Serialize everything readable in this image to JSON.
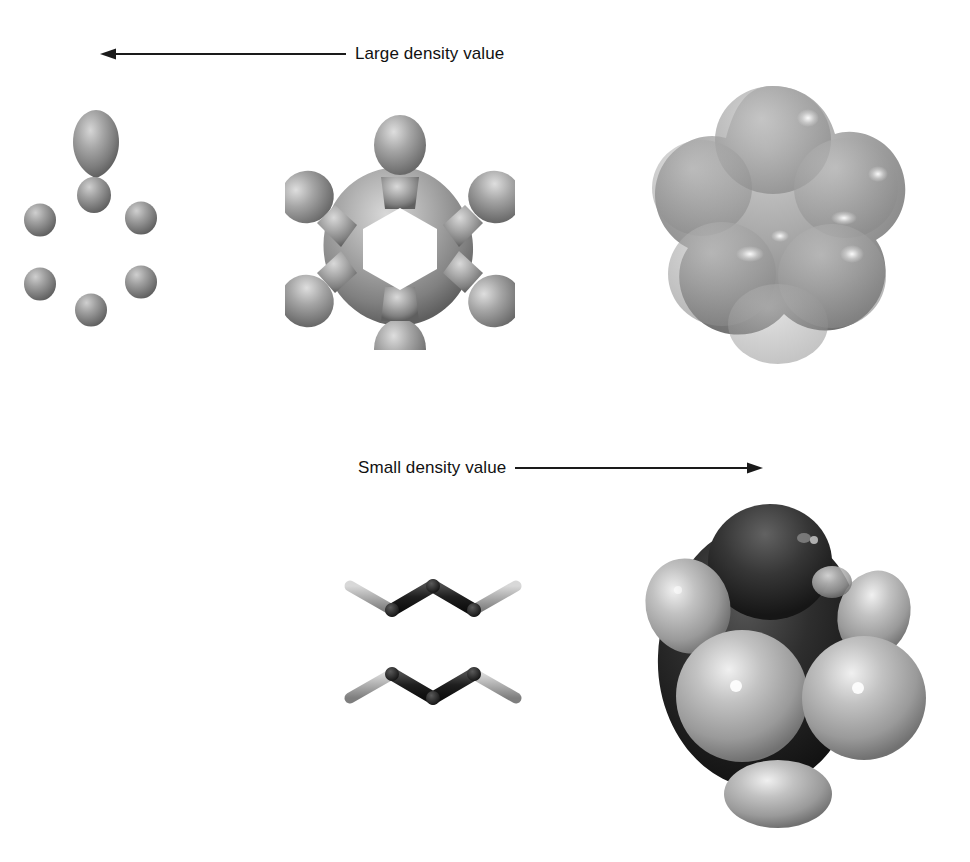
{
  "figure": {
    "background_color": "#ffffff",
    "annotations": {
      "top": {
        "label": "Large density value",
        "arrow_direction": "left",
        "icon": "left-arrow-icon"
      },
      "bottom": {
        "label": "Small density value",
        "arrow_direction": "right",
        "icon": "right-arrow-icon"
      }
    },
    "panels": [
      {
        "id": "iso-high",
        "name": "electron-density-isosurface-high",
        "description": "Seven disconnected rounded blobs: one large teardrop at top with a smaller lobe beneath it, and six small spheres arranged in a hexagon",
        "blob_count": 7,
        "surface_color": "#9a9a9a",
        "highlight_color": "#d8d8d8",
        "shadow_color": "#5e5e5e"
      },
      {
        "id": "iso-mid",
        "name": "electron-density-isosurface-medium",
        "description": "Connected six-pointed star / gear shaped surface with a hexagonal hole in the centre",
        "lobe_count": 6,
        "has_central_hole": true,
        "surface_color": "#a2a2a2",
        "highlight_color": "#e2e2e2",
        "shadow_color": "#636363"
      },
      {
        "id": "iso-low",
        "name": "electron-density-isosurface-low",
        "description": "Smooth bumpy closed blob enveloping the whole molecule with six gentle bulges and specular highlights",
        "bulge_count": 6,
        "surface_color": "#a9a9a9",
        "highlight_color": "#f2f2f2",
        "shadow_color": "#6a6a6a"
      },
      {
        "id": "stick",
        "name": "benzene-stick-model",
        "description": "Benzene ball-and-stick skeleton: dark hexagonal carbon ring with six light grey hydrogen bonds radiating outward",
        "ring_atoms": 6,
        "hydrogen_count": 6,
        "carbon_color": "#262626",
        "hydrogen_color": "#b4b4b4"
      },
      {
        "id": "cpk",
        "name": "benzene-space-filling-model",
        "description": "CPK space-filling benzene: six large dark carbon spheres overlapped by six lighter grey hydrogen spheres",
        "carbon_count": 6,
        "hydrogen_count": 6,
        "carbon_color": "#2a2a2a",
        "hydrogen_color": "#b8b8b8",
        "highlight_color": "#f0f0f0"
      }
    ]
  }
}
